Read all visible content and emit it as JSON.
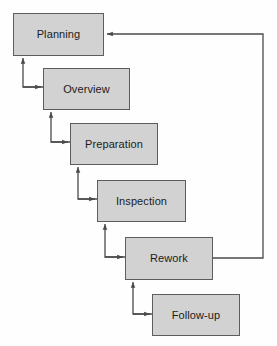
{
  "diagram": {
    "type": "flowchart",
    "background_color": "#fefefe",
    "node_fill_color": "#d2d2d2",
    "node_border_color": "#5d5d5d",
    "connector_color": "#4a4a4a",
    "text_color": "#1b1b1b",
    "nodes": [
      {
        "id": "planning",
        "label": "Planning",
        "x": 13,
        "y": 13,
        "width": 91,
        "height": 43
      },
      {
        "id": "overview",
        "label": "Overview",
        "x": 43,
        "y": 68,
        "width": 87,
        "height": 42
      },
      {
        "id": "preparation",
        "label": "Preparation",
        "x": 70,
        "y": 123,
        "width": 88,
        "height": 42
      },
      {
        "id": "inspection",
        "label": "Inspection",
        "x": 97,
        "y": 180,
        "width": 89,
        "height": 42
      },
      {
        "id": "rework",
        "label": "Rework",
        "x": 125,
        "y": 237,
        "width": 88,
        "height": 43
      },
      {
        "id": "followup",
        "label": "Follow-up",
        "x": 152,
        "y": 294,
        "width": 88,
        "height": 42
      }
    ],
    "connectors": [
      {
        "id": "planning-overview",
        "from": "planning",
        "to": "overview",
        "kind": "step-down-right"
      },
      {
        "id": "overview-preparation",
        "from": "overview",
        "to": "preparation",
        "kind": "step-down-right"
      },
      {
        "id": "preparation-inspection",
        "from": "preparation",
        "to": "inspection",
        "kind": "step-down-right"
      },
      {
        "id": "inspection-rework",
        "from": "inspection",
        "to": "rework",
        "kind": "step-down-right"
      },
      {
        "id": "rework-followup",
        "from": "rework",
        "to": "followup",
        "kind": "step-down-right"
      },
      {
        "id": "rework-planning-feedback",
        "from": "rework",
        "to": "planning",
        "kind": "feedback-loop"
      }
    ]
  }
}
